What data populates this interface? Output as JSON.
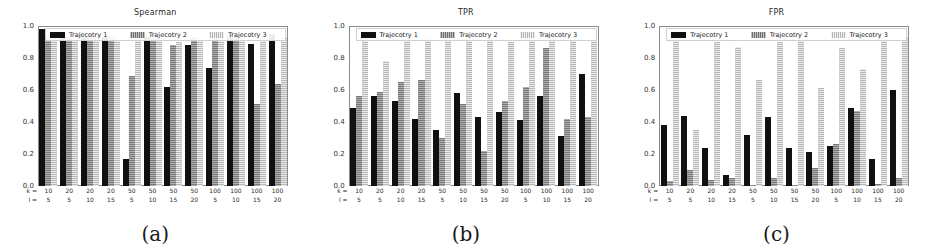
{
  "figure": {
    "panels": [
      {
        "caption": "(a)",
        "title": "Spearman",
        "legend": [
          "Trajecotry 1",
          "Trajecotry 2",
          "Trajecotry 3"
        ],
        "x_prefix_row1": "k =",
        "x_prefix_row2": "l =",
        "yticks": [
          "1.0",
          "0.8",
          "0.6",
          "0.4",
          "0.2",
          "0.0"
        ]
      },
      {
        "caption": "(b)",
        "title": "TPR",
        "legend": [
          "Trajecotry 1",
          "Trajecotry 2",
          "Trajecotry 3"
        ],
        "x_prefix_row1": "k =",
        "x_prefix_row2": "l =",
        "yticks": [
          "1.0",
          "0.8",
          "0.6",
          "0.4",
          "0.2",
          "0.0"
        ]
      },
      {
        "caption": "(c)",
        "title": "FPR",
        "legend": [
          "Trajecotry 1",
          "Trajecotry 2",
          "Trajecotry 3"
        ],
        "x_prefix_row1": "k =",
        "x_prefix_row2": "l =",
        "yticks": [
          "1.0",
          "0.8",
          "0.6",
          "0.4",
          "0.2",
          "0.0"
        ]
      }
    ]
  },
  "chart_data": [
    {
      "type": "bar",
      "title": "Spearman",
      "xlabel": "k / l",
      "ylabel": "",
      "ylim": [
        0,
        1.0
      ],
      "yticks": [
        0.0,
        0.2,
        0.4,
        0.6,
        0.8,
        1.0
      ],
      "grid": false,
      "legend_position": "top-inside",
      "categories": [
        "10/5",
        "20/5",
        "20/10",
        "20/15",
        "50/5",
        "50/10",
        "50/15",
        "50/20",
        "100/5",
        "100/10",
        "100/15",
        "100/20"
      ],
      "k_values": [
        10,
        20,
        20,
        20,
        50,
        50,
        50,
        50,
        100,
        100,
        100,
        100
      ],
      "l_values": [
        5,
        5,
        10,
        15,
        5,
        10,
        15,
        20,
        5,
        10,
        15,
        20
      ],
      "series": [
        {
          "name": "Trajecotry 1",
          "values": [
            0.98,
            0.93,
            0.93,
            0.93,
            0.17,
            0.93,
            0.62,
            0.88,
            0.74,
            0.93,
            0.89,
            0.95
          ]
        },
        {
          "name": "Trajecotry 2",
          "values": [
            0.93,
            0.93,
            0.93,
            0.93,
            0.69,
            0.93,
            0.88,
            0.93,
            0.93,
            0.93,
            0.51,
            0.64
          ]
        },
        {
          "name": "Trajecotry 3",
          "values": [
            0.93,
            0.93,
            0.93,
            0.93,
            0.93,
            0.93,
            0.9,
            0.93,
            0.93,
            0.93,
            0.93,
            0.93
          ]
        }
      ]
    },
    {
      "type": "bar",
      "title": "TPR",
      "xlabel": "k / l",
      "ylabel": "",
      "ylim": [
        0,
        1.0
      ],
      "yticks": [
        0.0,
        0.2,
        0.4,
        0.6,
        0.8,
        1.0
      ],
      "grid": false,
      "legend_position": "top-inside",
      "categories": [
        "10/5",
        "20/5",
        "20/10",
        "20/15",
        "50/5",
        "50/10",
        "50/15",
        "50/20",
        "100/5",
        "100/10",
        "100/15",
        "100/20"
      ],
      "k_values": [
        10,
        20,
        20,
        20,
        50,
        50,
        50,
        50,
        100,
        100,
        100,
        100
      ],
      "l_values": [
        5,
        5,
        10,
        15,
        5,
        10,
        15,
        20,
        5,
        10,
        15,
        20
      ],
      "series": [
        {
          "name": "Trajecotry 1",
          "values": [
            0.49,
            0.56,
            0.53,
            0.42,
            0.35,
            0.58,
            0.43,
            0.46,
            0.41,
            0.56,
            0.31,
            0.7
          ]
        },
        {
          "name": "Trajecotry 2",
          "values": [
            0.56,
            0.59,
            0.65,
            0.66,
            0.3,
            0.51,
            0.22,
            0.53,
            0.62,
            0.86,
            0.42,
            0.43
          ]
        },
        {
          "name": "Trajecotry 3",
          "values": [
            0.97,
            0.78,
            0.93,
            0.93,
            0.93,
            0.93,
            0.93,
            0.9,
            0.93,
            0.93,
            0.93,
            0.97
          ]
        }
      ]
    },
    {
      "type": "bar",
      "title": "FPR",
      "xlabel": "k / l",
      "ylabel": "",
      "ylim": [
        0,
        1.0
      ],
      "yticks": [
        0.0,
        0.2,
        0.4,
        0.6,
        0.8,
        1.0
      ],
      "grid": false,
      "legend_position": "top-inside",
      "categories": [
        "10/5",
        "20/5",
        "20/10",
        "20/15",
        "50/5",
        "50/10",
        "50/15",
        "50/20",
        "100/5",
        "100/10",
        "100/15",
        "100/20"
      ],
      "k_values": [
        10,
        20,
        20,
        20,
        50,
        50,
        50,
        50,
        100,
        100,
        100,
        100
      ],
      "l_values": [
        5,
        5,
        10,
        15,
        5,
        10,
        15,
        20,
        5,
        10,
        15,
        20
      ],
      "series": [
        {
          "name": "Trajecotry 1",
          "values": [
            0.38,
            0.44,
            0.24,
            0.07,
            0.32,
            0.43,
            0.24,
            0.21,
            0.25,
            0.49,
            0.17,
            0.6
          ]
        },
        {
          "name": "Trajecotry 2",
          "values": [
            0.03,
            0.1,
            0.04,
            0.05,
            0.0,
            0.05,
            0.0,
            0.11,
            0.26,
            0.47,
            0.01,
            0.05
          ]
        },
        {
          "name": "Trajecotry 3",
          "values": [
            0.93,
            0.35,
            0.9,
            0.87,
            0.66,
            0.9,
            0.95,
            0.61,
            0.86,
            0.73,
            0.93,
            0.93
          ]
        }
      ]
    }
  ]
}
